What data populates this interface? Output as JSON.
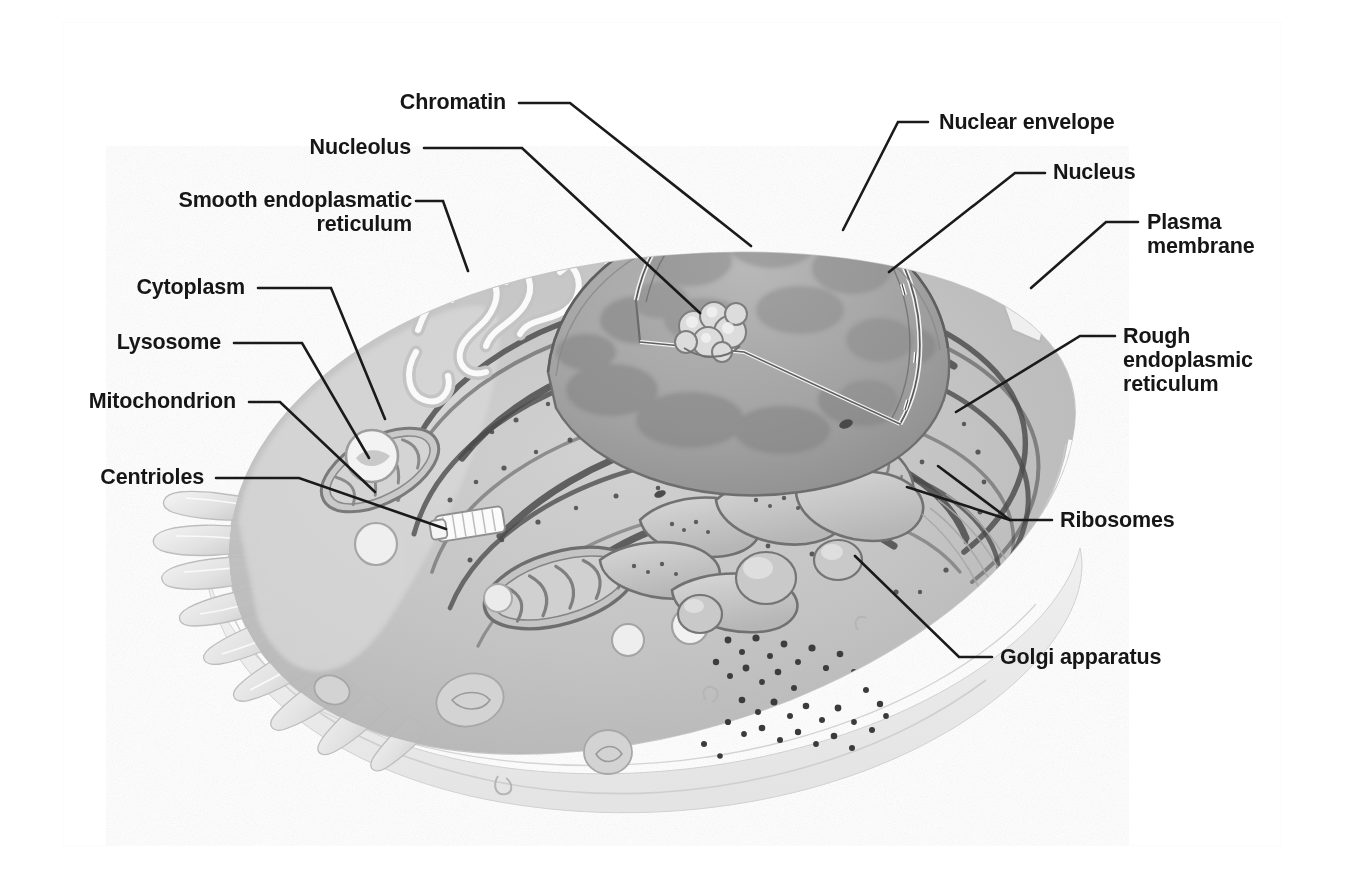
{
  "figure": {
    "style": "grayscale airbrush illustration with leader-line callouts",
    "background_color": "#ffffff",
    "leader_line_color": "#1a1a1a",
    "label_text_color": "#161616"
  },
  "labels": [
    {
      "id": "chromatin",
      "text": "Chromatin",
      "align": "right",
      "text_x": 378,
      "text_y": 90,
      "text_w": 128,
      "elbow": [
        [
          519,
          103
        ],
        [
          570,
          103
        ],
        [
          751,
          246
        ]
      ]
    },
    {
      "id": "nucleolus",
      "text": "Nucleolus",
      "align": "right",
      "text_x": 289,
      "text_y": 135,
      "text_w": 122,
      "elbow": [
        [
          424,
          148
        ],
        [
          522,
          148
        ],
        [
          700,
          313
        ]
      ]
    },
    {
      "id": "smooth-endoplasmatic-reticulum",
      "text": "Smooth endoplasmatic\nreticulum",
      "align": "right",
      "text_x": 160,
      "text_y": 188,
      "text_w": 252,
      "elbow": [
        [
          416,
          201
        ],
        [
          443,
          201
        ],
        [
          468,
          271
        ]
      ]
    },
    {
      "id": "cytoplasm",
      "text": "Cytoplasm",
      "align": "right",
      "text_x": 113,
      "text_y": 275,
      "text_w": 132,
      "elbow": [
        [
          258,
          288
        ],
        [
          331,
          288
        ],
        [
          385,
          419
        ]
      ]
    },
    {
      "id": "lysosome",
      "text": "Lysosome",
      "align": "right",
      "text_x": 100,
      "text_y": 330,
      "text_w": 121,
      "elbow": [
        [
          234,
          343
        ],
        [
          302,
          343
        ],
        [
          369,
          458
        ]
      ]
    },
    {
      "id": "mitochondrion",
      "text": "Mitochondrion",
      "align": "right",
      "text_x": 58,
      "text_y": 389,
      "text_w": 178,
      "elbow": [
        [
          249,
          402
        ],
        [
          280,
          402
        ],
        [
          375,
          492
        ]
      ]
    },
    {
      "id": "centrioles",
      "text": "Centrioles",
      "align": "right",
      "text_x": 85,
      "text_y": 465,
      "text_w": 119,
      "elbow": [
        [
          216,
          478
        ],
        [
          299,
          478
        ],
        [
          446,
          529
        ]
      ]
    },
    {
      "id": "nuclear-envelope",
      "text": "Nuclear envelope",
      "align": "left",
      "text_x": 939,
      "text_y": 110,
      "text_w": 209,
      "elbow": [
        [
          928,
          122
        ],
        [
          898,
          122
        ],
        [
          843,
          230
        ]
      ]
    },
    {
      "id": "nucleus",
      "text": "Nucleus",
      "align": "left",
      "text_x": 1053,
      "text_y": 160,
      "text_w": 100,
      "elbow": [
        [
          1045,
          173
        ],
        [
          1015,
          173
        ],
        [
          889,
          272
        ]
      ]
    },
    {
      "id": "plasma-membrane",
      "text": "Plasma\nmembrane",
      "align": "left",
      "text_x": 1147,
      "text_y": 210,
      "text_w": 135,
      "elbow": [
        [
          1138,
          222
        ],
        [
          1106,
          222
        ],
        [
          1031,
          288
        ]
      ]
    },
    {
      "id": "rough-endoplasmic-reticulum",
      "text": "Rough\nendoplasmic\nreticulum",
      "align": "left",
      "text_x": 1123,
      "text_y": 324,
      "text_w": 156,
      "elbow": [
        [
          1115,
          336
        ],
        [
          1080,
          336
        ],
        [
          956,
          412
        ]
      ]
    },
    {
      "id": "ribosomes",
      "text": "Ribosomes",
      "align": "left",
      "text_x": 1060,
      "text_y": 508,
      "text_w": 140,
      "elbow": [
        [
          1052,
          520
        ],
        [
          1010,
          520
        ],
        [
          938,
          466
        ]
      ],
      "extra_branch": [
        [
          1010,
          520
        ],
        [
          907,
          487
        ]
      ]
    },
    {
      "id": "golgi-apparatus",
      "text": "Golgi apparatus",
      "align": "left",
      "text_x": 1000,
      "text_y": 645,
      "text_w": 198,
      "elbow": [
        [
          992,
          657
        ],
        [
          959,
          657
        ],
        [
          855,
          556
        ]
      ]
    }
  ],
  "cell_structures": [
    {
      "name": "plasma-membrane",
      "description": "outer pale membrane enclosing the cell"
    },
    {
      "name": "microvilli",
      "description": "finger-like projections along the left edge"
    },
    {
      "name": "nucleus",
      "description": "large cut-away dome at upper centre"
    },
    {
      "name": "nuclear-envelope",
      "description": "double membrane around the nucleus with pores"
    },
    {
      "name": "chromatin",
      "description": "mottled granular material inside the nucleus"
    },
    {
      "name": "nucleolus",
      "description": "dense knobby cluster inside the nucleus"
    },
    {
      "name": "rough-endoplasmic-reticulum",
      "description": "concentric ribosome-studded sheets around the nucleus"
    },
    {
      "name": "smooth-endoplasmatic-reticulum",
      "description": "tubular network at the upper left"
    },
    {
      "name": "golgi-apparatus",
      "description": "stacked flattened cisternae with budding vesicles at lower right"
    },
    {
      "name": "mitochondrion",
      "description": "oval organelles with internal cristae"
    },
    {
      "name": "lysosome",
      "description": "small round vesicles in the cytoplasm"
    },
    {
      "name": "centrioles",
      "description": "pair of pale cylinders near cell centre"
    },
    {
      "name": "ribosomes",
      "description": "dark dots on ER membranes and free in cytoplasm"
    },
    {
      "name": "cytoplasm",
      "description": "pale ground substance filling the cell"
    },
    {
      "name": "secretory-vesicles",
      "description": "scattered dark granules near the lower right membrane"
    }
  ]
}
